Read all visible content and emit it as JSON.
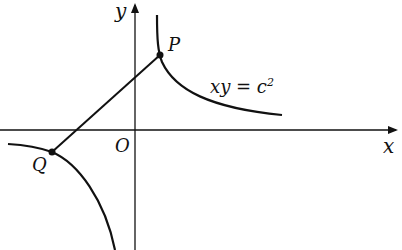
{
  "diagram": {
    "axes": {
      "x_label": "x",
      "y_label": "y",
      "origin_label": "O"
    },
    "curve_label": "xy = c",
    "curve_label_sup": "2",
    "points": [
      {
        "name": "P",
        "branch": "first quadrant"
      },
      {
        "name": "Q",
        "branch": "third quadrant"
      }
    ],
    "segments": [
      {
        "from": "P",
        "to": "Q",
        "passes_near": "O"
      }
    ],
    "colors": {
      "ink": "#111111",
      "background": "#ffffff"
    }
  }
}
